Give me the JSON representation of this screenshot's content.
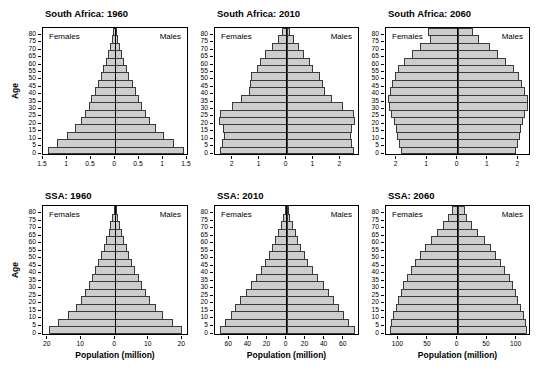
{
  "figure": {
    "females_label": "Females",
    "males_label": "Males",
    "age_ticks": [
      0,
      5,
      10,
      15,
      20,
      25,
      30,
      35,
      40,
      45,
      50,
      55,
      60,
      65,
      70,
      75,
      80
    ],
    "age_axis_max": 85,
    "bar_color": "#cdcdcd",
    "bar_border_color": "#3a3a3a",
    "box_border_color": "#000000",
    "grid": "off",
    "legend_position": "females top-left, males top-right inside plot"
  },
  "chart_data": [
    {
      "type": "bar",
      "subtype": "population-pyramid",
      "title": "South Africa: 1960",
      "ylabel": "Age",
      "xlabel": "",
      "xlim": [
        -1.5,
        1.5
      ],
      "xtick_values": [
        -1.5,
        -1,
        -0.5,
        0,
        0.5,
        1,
        1.5
      ],
      "xtick_labels": [
        "1.5",
        "1",
        "0.5",
        "0",
        "0.5",
        "1",
        "1.5"
      ],
      "age_groups": [
        "0-4",
        "5-9",
        "10-14",
        "15-19",
        "20-24",
        "25-29",
        "30-34",
        "35-39",
        "40-44",
        "45-49",
        "50-54",
        "55-59",
        "60-64",
        "65-69",
        "70-74",
        "75-79",
        "80+"
      ],
      "units": "million persons",
      "series": [
        {
          "name": "Females",
          "values": [
            1.4,
            1.2,
            1.0,
            0.83,
            0.7,
            0.62,
            0.55,
            0.49,
            0.42,
            0.36,
            0.29,
            0.24,
            0.19,
            0.14,
            0.1,
            0.06,
            0.04
          ]
        },
        {
          "name": "Males",
          "values": [
            1.42,
            1.21,
            1.01,
            0.84,
            0.7,
            0.62,
            0.55,
            0.48,
            0.41,
            0.35,
            0.28,
            0.22,
            0.17,
            0.12,
            0.08,
            0.05,
            0.02
          ]
        }
      ]
    },
    {
      "type": "bar",
      "subtype": "population-pyramid",
      "title": "South Africa: 2010",
      "ylabel": "",
      "xlabel": "",
      "xlim": [
        -2.65,
        2.65
      ],
      "xtick_values": [
        -2,
        -1,
        0,
        1,
        2
      ],
      "xtick_labels": [
        "2",
        "1",
        "0",
        "1",
        "2"
      ],
      "age_groups": [
        "0-4",
        "5-9",
        "10-14",
        "15-19",
        "20-24",
        "25-29",
        "30-34",
        "35-39",
        "40-44",
        "45-49",
        "50-54",
        "55-59",
        "60-64",
        "65-69",
        "70-74",
        "75-79",
        "80+"
      ],
      "units": "million persons",
      "series": [
        {
          "name": "Females",
          "values": [
            2.45,
            2.38,
            2.32,
            2.37,
            2.5,
            2.47,
            2.02,
            1.67,
            1.4,
            1.35,
            1.32,
            1.08,
            0.98,
            0.78,
            0.55,
            0.33,
            0.16
          ]
        },
        {
          "name": "Males",
          "values": [
            2.48,
            2.4,
            2.34,
            2.38,
            2.52,
            2.48,
            2.04,
            1.65,
            1.38,
            1.3,
            1.22,
            0.96,
            0.84,
            0.63,
            0.42,
            0.23,
            0.1
          ]
        }
      ]
    },
    {
      "type": "bar",
      "subtype": "population-pyramid",
      "title": "South Africa: 2060",
      "ylabel": "",
      "xlabel": "",
      "xlim": [
        -2.35,
        2.35
      ],
      "xtick_values": [
        -2,
        -1,
        0,
        1,
        2
      ],
      "xtick_labels": [
        "2",
        "1",
        "0",
        "1",
        "2"
      ],
      "age_groups": [
        "0-4",
        "5-9",
        "10-14",
        "15-19",
        "20-24",
        "25-29",
        "30-34",
        "35-39",
        "40-44",
        "45-49",
        "50-54",
        "55-59",
        "60-64",
        "65-69",
        "70-74",
        "75-79",
        "80+"
      ],
      "units": "million persons",
      "series": [
        {
          "name": "Females",
          "values": [
            1.85,
            1.92,
            1.98,
            2.03,
            2.1,
            2.18,
            2.25,
            2.28,
            2.22,
            2.15,
            2.05,
            1.95,
            1.75,
            1.5,
            1.22,
            0.92,
            0.97
          ]
        },
        {
          "name": "Males",
          "values": [
            1.88,
            1.95,
            2.02,
            2.07,
            2.12,
            2.2,
            2.27,
            2.28,
            2.2,
            2.1,
            2.0,
            1.82,
            1.57,
            1.3,
            1.02,
            0.68,
            0.47
          ]
        }
      ]
    },
    {
      "type": "bar",
      "subtype": "population-pyramid",
      "title": "SSA: 1960",
      "ylabel": "Age",
      "xlabel": "Population (million)",
      "xlim": [
        -21.4,
        21.4
      ],
      "xtick_values": [
        -20,
        -10,
        0,
        10,
        20
      ],
      "xtick_labels": [
        "20",
        "10",
        "0",
        "10",
        "20"
      ],
      "age_groups": [
        "0-4",
        "5-9",
        "10-14",
        "15-19",
        "20-24",
        "25-29",
        "30-34",
        "35-39",
        "40-44",
        "45-49",
        "50-54",
        "55-59",
        "60-64",
        "65-69",
        "70-74",
        "75-79",
        "80+"
      ],
      "units": "million persons",
      "series": [
        {
          "name": "Females",
          "values": [
            19.5,
            16.8,
            13.9,
            11.7,
            10.2,
            8.8,
            7.8,
            6.8,
            5.8,
            5.0,
            4.1,
            3.3,
            2.6,
            1.9,
            1.4,
            0.8,
            0.4
          ]
        },
        {
          "name": "Males",
          "values": [
            19.7,
            16.9,
            14.0,
            11.8,
            10.2,
            8.8,
            7.7,
            6.7,
            5.7,
            4.9,
            4.0,
            3.2,
            2.5,
            1.8,
            1.2,
            0.7,
            0.3
          ]
        }
      ]
    },
    {
      "type": "bar",
      "subtype": "population-pyramid",
      "title": "SSA: 2010",
      "ylabel": "",
      "xlabel": "Population (million)",
      "xlim": [
        -75,
        75
      ],
      "xtick_values": [
        -60,
        -40,
        -20,
        0,
        20,
        40,
        60
      ],
      "xtick_labels": [
        "60",
        "40",
        "20",
        "0",
        "20",
        "40",
        "60"
      ],
      "age_groups": [
        "0-4",
        "5-9",
        "10-14",
        "15-19",
        "20-24",
        "25-29",
        "30-34",
        "35-39",
        "40-44",
        "45-49",
        "50-54",
        "55-59",
        "60-64",
        "65-69",
        "70-74",
        "75-79",
        "80+"
      ],
      "units": "million persons",
      "series": [
        {
          "name": "Females",
          "values": [
            70,
            64,
            58.5,
            54,
            48.5,
            43,
            37.5,
            32,
            27,
            22.5,
            18.5,
            15,
            12,
            9,
            6.2,
            3.5,
            1.7
          ]
        },
        {
          "name": "Males",
          "values": [
            71,
            65,
            59.5,
            54.5,
            49,
            43.5,
            38,
            32,
            26.5,
            22,
            18,
            14.5,
            11.5,
            8.5,
            5.5,
            3.0,
            1.2
          ]
        }
      ]
    },
    {
      "type": "bar",
      "subtype": "population-pyramid",
      "title": "SSA: 2060",
      "ylabel": "",
      "xlabel": "Population (million)",
      "xlim": [
        -121,
        121
      ],
      "xtick_values": [
        -100,
        -50,
        0,
        50,
        100
      ],
      "xtick_labels": [
        "100",
        "50",
        "0",
        "50",
        "100"
      ],
      "age_groups": [
        "0-4",
        "5-9",
        "10-14",
        "15-19",
        "20-24",
        "25-29",
        "30-34",
        "35-39",
        "40-44",
        "45-49",
        "50-54",
        "55-59",
        "60-64",
        "65-69",
        "70-74",
        "75-79",
        "80+"
      ],
      "units": "million persons",
      "series": [
        {
          "name": "Females",
          "values": [
            115,
            113,
            109,
            104.5,
            100.5,
            96,
            91.5,
            86,
            79,
            72,
            64,
            55.5,
            45,
            35,
            24,
            16,
            10
          ]
        },
        {
          "name": "Males",
          "values": [
            116,
            114,
            110,
            105.5,
            101,
            97,
            92,
            86.5,
            79.5,
            72,
            63.5,
            54.5,
            44,
            33.5,
            22.5,
            14.5,
            10.5
          ]
        }
      ]
    }
  ]
}
